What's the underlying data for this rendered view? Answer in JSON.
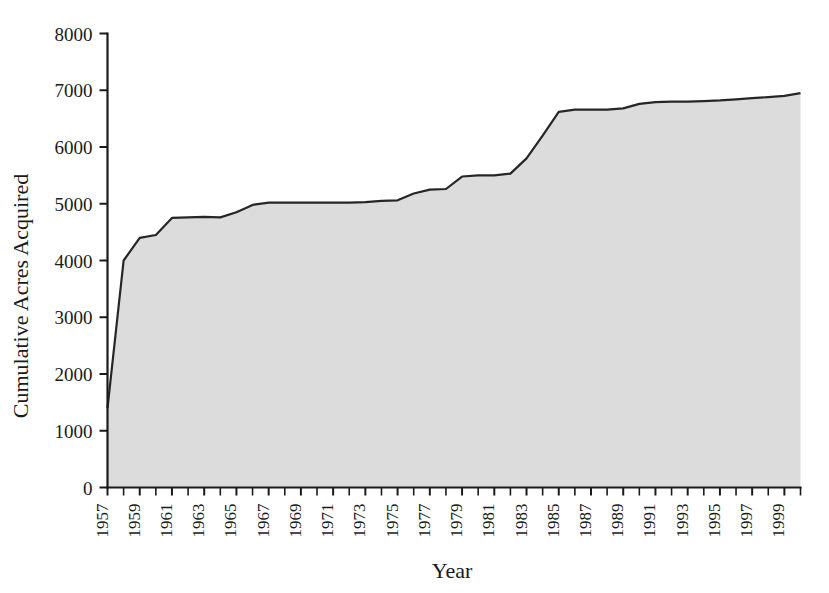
{
  "chart_data": {
    "type": "area",
    "title": "",
    "xlabel": "Year",
    "ylabel": "Cumulative Acres Acquired",
    "xlim": [
      1957,
      2000
    ],
    "ylim": [
      0,
      8000
    ],
    "grid": false,
    "legend": null,
    "y_ticks": [
      0,
      1000,
      2000,
      3000,
      4000,
      5000,
      6000,
      7000,
      8000
    ],
    "y_tick_labels": [
      "0",
      "1000",
      "2000",
      "3000",
      "4000",
      "5000",
      "6000",
      "7000",
      "8000"
    ],
    "x_tick_labels": [
      "1957",
      "1959",
      "1961",
      "1963",
      "1965",
      "1967",
      "1969",
      "1971",
      "1973",
      "1975",
      "1977",
      "1979",
      "1981",
      "1983",
      "1985",
      "1987",
      "1989",
      "1991",
      "1993",
      "1995",
      "1997",
      "1999"
    ],
    "x_tick_label_interval": 2,
    "x_minor_tick_interval": 1,
    "series_name": "Cumulative Acres Acquired",
    "fill_color": "#dcdcdc",
    "line_color": "#262626",
    "x": [
      1957,
      1958,
      1959,
      1960,
      1961,
      1962,
      1963,
      1964,
      1965,
      1966,
      1967,
      1968,
      1969,
      1970,
      1971,
      1972,
      1973,
      1974,
      1975,
      1976,
      1977,
      1978,
      1979,
      1980,
      1981,
      1982,
      1983,
      1984,
      1985,
      1986,
      1987,
      1988,
      1989,
      1990,
      1991,
      1992,
      1993,
      1994,
      1995,
      1996,
      1997,
      1998,
      1999,
      2000
    ],
    "values": [
      1400,
      4000,
      4400,
      4450,
      4750,
      4760,
      4770,
      4760,
      4850,
      4980,
      5020,
      5020,
      5020,
      5020,
      5020,
      5020,
      5030,
      5050,
      5060,
      5180,
      5250,
      5260,
      5480,
      5500,
      5500,
      5530,
      5800,
      6200,
      6620,
      6660,
      6660,
      6660,
      6680,
      6760,
      6790,
      6800,
      6800,
      6810,
      6820,
      6840,
      6860,
      6880,
      6900,
      6950
    ]
  }
}
